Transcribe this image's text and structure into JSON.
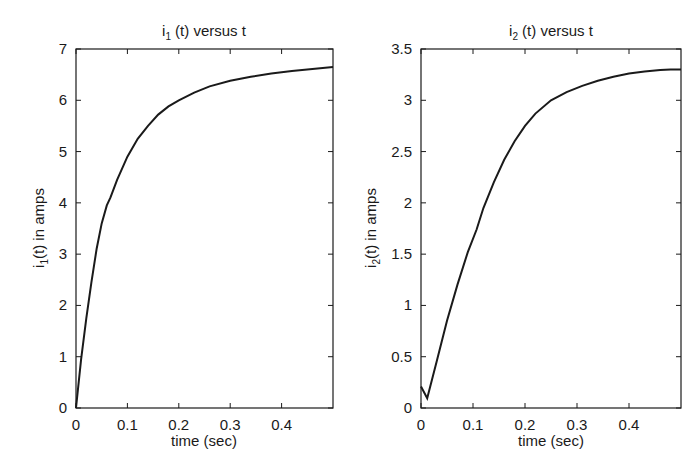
{
  "chart_data": [
    {
      "type": "line",
      "title": "i1 (t) versus t",
      "title_parts": {
        "pre": "i",
        "sub": "1",
        "post": " (t) versus t"
      },
      "xlabel": "time (sec)",
      "ylabel": "i1(t) in amps",
      "ylabel_parts": {
        "pre": "i",
        "sub": "1",
        "post": "(t) in amps"
      },
      "xlim": [
        0,
        0.5
      ],
      "ylim": [
        0,
        7
      ],
      "xticks": [
        0,
        0.1,
        0.2,
        0.3,
        0.4
      ],
      "xtick_labels": [
        "0",
        "0.1",
        "0.2",
        "0.3",
        "0.4"
      ],
      "yticks": [
        0,
        1,
        2,
        3,
        4,
        5,
        6,
        7
      ],
      "ytick_labels": [
        "0",
        "1",
        "2",
        "3",
        "4",
        "5",
        "6",
        "7"
      ],
      "grid": false,
      "series": [
        {
          "name": "i1(t)",
          "color": "#1a1a1a",
          "x": [
            0,
            0.01,
            0.02,
            0.03,
            0.04,
            0.05,
            0.06,
            0.067,
            0.08,
            0.1,
            0.12,
            0.14,
            0.16,
            0.18,
            0.2,
            0.23,
            0.26,
            0.3,
            0.34,
            0.38,
            0.42,
            0.46,
            0.5
          ],
          "y": [
            0,
            0.95,
            1.75,
            2.45,
            3.1,
            3.6,
            3.95,
            4.1,
            4.45,
            4.9,
            5.25,
            5.5,
            5.72,
            5.88,
            6.0,
            6.15,
            6.27,
            6.38,
            6.46,
            6.52,
            6.57,
            6.61,
            6.65
          ]
        }
      ]
    },
    {
      "type": "line",
      "title": "i2 (t) versus t",
      "title_parts": {
        "pre": "i",
        "sub": "2",
        "post": " (t) versus t"
      },
      "xlabel": "time (sec)",
      "ylabel": "i2(t) in amps",
      "ylabel_parts": {
        "pre": "i",
        "sub": "2",
        "post": "(t) in amps"
      },
      "xlim": [
        0,
        0.5
      ],
      "ylim": [
        0,
        3.5
      ],
      "xticks": [
        0,
        0.1,
        0.2,
        0.3,
        0.4
      ],
      "xtick_labels": [
        "0",
        "0.1",
        "0.2",
        "0.3",
        "0.4"
      ],
      "yticks": [
        0,
        0.5,
        1,
        1.5,
        2,
        2.5,
        3,
        3.5
      ],
      "ytick_labels": [
        "0",
        "0.5",
        "1",
        "1.5",
        "2",
        "2.5",
        "3",
        "3.5"
      ],
      "grid": false,
      "series": [
        {
          "name": "i2(t)",
          "color": "#1a1a1a",
          "x": [
            0,
            0.012,
            0.03,
            0.05,
            0.07,
            0.09,
            0.107,
            0.12,
            0.14,
            0.16,
            0.18,
            0.2,
            0.22,
            0.25,
            0.28,
            0.31,
            0.34,
            0.37,
            0.4,
            0.43,
            0.46,
            0.48,
            0.5
          ],
          "y": [
            0.21,
            0.095,
            0.45,
            0.85,
            1.2,
            1.52,
            1.74,
            1.95,
            2.2,
            2.42,
            2.6,
            2.75,
            2.87,
            3.0,
            3.08,
            3.14,
            3.19,
            3.23,
            3.26,
            3.28,
            3.295,
            3.3,
            3.3
          ]
        }
      ]
    }
  ]
}
